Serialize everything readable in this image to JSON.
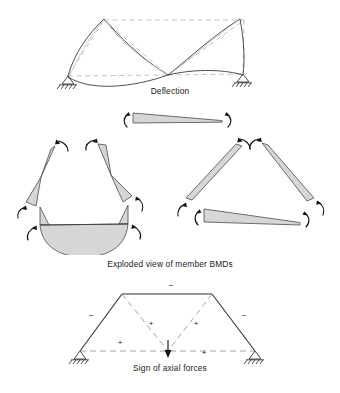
{
  "figure": {
    "background_color": "#ffffff",
    "line_color": "#3a3a3a",
    "ghost_color": "#b9b9b9",
    "bmd_fill_color": "#d6d6d6",
    "bmd_stroke_color": "#4a4a4a"
  },
  "panels": {
    "deflection": {
      "caption": "Deflection",
      "description": "Two-bay gabled frame showing undeformed dashed outline and deflected solid shape",
      "supports": [
        "pinned-left",
        "pinned-right"
      ]
    },
    "bmd": {
      "caption": "Exploded view of member BMDs",
      "description": "Exploded bending moment diagrams of each member with end-moment rotation arrows",
      "groups": [
        {
          "name": "top-beam",
          "members": 1
        },
        {
          "name": "left-bay",
          "members": 3
        },
        {
          "name": "right-bay",
          "members": 3
        }
      ]
    },
    "axial": {
      "caption": "Sign of axial forces",
      "description": "Frame outline with axial force signs on each member and a central point load",
      "signs": [
        {
          "id": "top-chord",
          "label": "−",
          "x": 171,
          "y": 16
        },
        {
          "id": "left-rafter",
          "label": "−",
          "x": 91,
          "y": 46
        },
        {
          "id": "right-rafter",
          "label": "−",
          "x": 244,
          "y": 46
        },
        {
          "id": "left-diagonal",
          "label": "+",
          "x": 151,
          "y": 54
        },
        {
          "id": "right-diagonal",
          "label": "+",
          "x": 196,
          "y": 54
        },
        {
          "id": "left-tie",
          "label": "+",
          "x": 120,
          "y": 73
        },
        {
          "id": "right-tie",
          "label": "+",
          "x": 204,
          "y": 83
        }
      ]
    }
  }
}
